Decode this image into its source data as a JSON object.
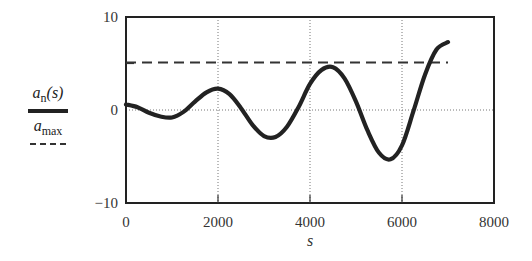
{
  "chart_data": {
    "type": "line",
    "title": "",
    "xlabel": "s",
    "ylabel": "",
    "xlim": [
      0,
      8000
    ],
    "ylim": [
      -10,
      10
    ],
    "xticks": [
      0,
      2000,
      4000,
      6000,
      8000
    ],
    "yticks": [
      -10,
      0,
      10
    ],
    "xtick_labels": [
      "0",
      "2000",
      "4000",
      "6000",
      "8000"
    ],
    "ytick_labels": [
      "−10",
      "0",
      "10"
    ],
    "grid": {
      "x": true,
      "y_zero_only": true,
      "style": "dotted"
    },
    "legend_position": "left",
    "series": [
      {
        "name": "a_n(s)",
        "label": "an(s)",
        "style": "solid-thick",
        "color": "#222222",
        "x": [
          0,
          250,
          500,
          750,
          1000,
          1250,
          1500,
          1750,
          2000,
          2250,
          2500,
          2750,
          3000,
          3250,
          3500,
          3750,
          4000,
          4250,
          4500,
          4750,
          5000,
          5250,
          5500,
          5750,
          6000,
          6250,
          6500,
          6750,
          7000
        ],
        "values": [
          0.6,
          0.3,
          -0.3,
          -0.7,
          -0.8,
          -0.2,
          0.9,
          1.9,
          2.3,
          1.7,
          0.2,
          -1.6,
          -2.8,
          -2.9,
          -1.8,
          0.3,
          2.8,
          4.3,
          4.6,
          3.4,
          0.9,
          -2.2,
          -4.6,
          -5.3,
          -3.8,
          -0.1,
          3.8,
          6.5,
          7.3
        ]
      },
      {
        "name": "a_max",
        "label": "amax",
        "style": "dashed",
        "color": "#333333",
        "x": [
          0,
          7000
        ],
        "values": [
          5.1,
          5.1
        ]
      }
    ]
  },
  "legend": {
    "series1_main": "a",
    "series1_sub": "n",
    "series1_tail": "(s)",
    "series2_main": "a",
    "series2_sub": "max"
  }
}
